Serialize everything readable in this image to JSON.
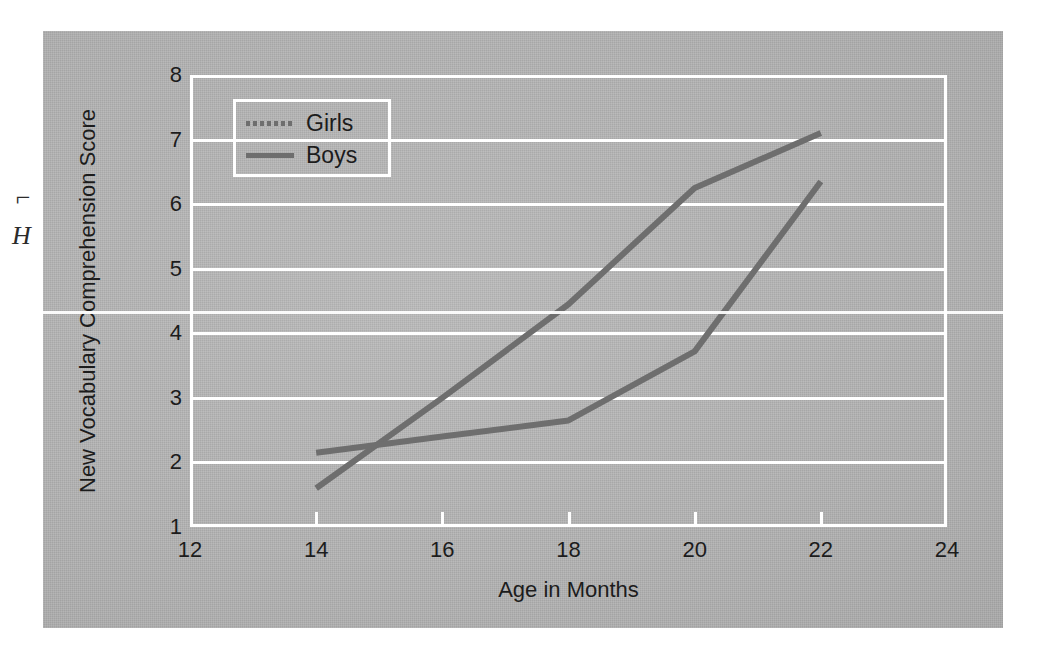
{
  "figure": {
    "background_color": "#b3b3b3",
    "grid_color": "#ffffff",
    "line_color": "#6e6e6e",
    "text_color": "#1c1c1c"
  },
  "margin_marks": {
    "mark_top": "⌐",
    "mark_bottom": "H"
  },
  "legend": {
    "position": "top-left-inside",
    "entries": [
      {
        "label": "Girls",
        "style": "dashed",
        "color": "#6e6e6e"
      },
      {
        "label": "Boys",
        "style": "solid",
        "color": "#6e6e6e"
      }
    ]
  },
  "chart_data": {
    "type": "line",
    "title": "",
    "subtitle": "",
    "xlabel": "Age in Months",
    "ylabel": "New Vocabulary Comprehension Score",
    "xlim": [
      12,
      24
    ],
    "ylim": [
      1,
      8
    ],
    "xticks": [
      12,
      14,
      16,
      18,
      20,
      22,
      24
    ],
    "yticks": [
      1,
      2,
      3,
      4,
      5,
      6,
      7,
      8
    ],
    "xtick_labels": [
      "12",
      "14",
      "16",
      "18",
      "20",
      "22",
      "24"
    ],
    "ytick_labels": [
      "1",
      "2",
      "3",
      "4",
      "5",
      "6",
      "7",
      "8"
    ],
    "grid": "horizontal",
    "legend_position": "upper left",
    "x": [
      14,
      16,
      18,
      20,
      22
    ],
    "series": [
      {
        "name": "Girls",
        "style": "dashed",
        "color": "#6e6e6e",
        "values": [
          1.6,
          3.0,
          4.45,
          6.25,
          7.1
        ]
      },
      {
        "name": "Boys",
        "style": "solid",
        "color": "#6e6e6e",
        "values": [
          2.15,
          2.4,
          2.65,
          3.72,
          6.35
        ]
      }
    ]
  }
}
